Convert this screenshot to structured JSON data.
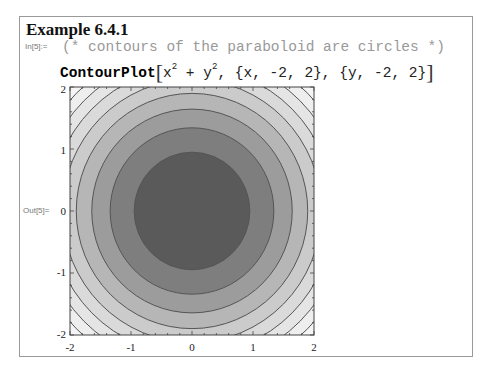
{
  "example": {
    "title": "Example 6.4.1"
  },
  "input": {
    "label": "In[5]:=",
    "comment": "(* contours of the paraboloid are circles *)",
    "function": "ContourPlot",
    "open_bracket": "[",
    "close_bracket": "]",
    "expr_x": "x",
    "exp_x": "2",
    "plus": " + ",
    "expr_y": "y",
    "exp_y": "2",
    "ranges": ", {x, -2, 2}, {y, -2, 2}"
  },
  "output": {
    "label": "Out[5]="
  },
  "colors": {
    "frame": "#9a9a9a",
    "contour_line": "#555555",
    "band_fills": [
      "#5a5a5a",
      "#7e7e7e",
      "#9c9c9c",
      "#b6b6b6",
      "#cbcbcb",
      "#dadada",
      "#e5e5e5",
      "#eeeeee",
      "#f5f5f5"
    ]
  },
  "chart_data": {
    "type": "contour",
    "function": "x^2 + y^2",
    "x_range": [
      -2,
      2
    ],
    "y_range": [
      -2,
      2
    ],
    "x_ticks": [
      "-2",
      "-1",
      "0",
      "1",
      "2"
    ],
    "y_ticks": [
      "-2",
      "-1",
      "0",
      "1",
      "2"
    ],
    "contour_levels_r2": [
      0.9,
      1.8,
      2.7,
      3.6,
      4.5,
      5.4,
      6.3,
      7.2
    ],
    "shading": "darker toward center (low values)",
    "grid": false,
    "legend": null
  }
}
